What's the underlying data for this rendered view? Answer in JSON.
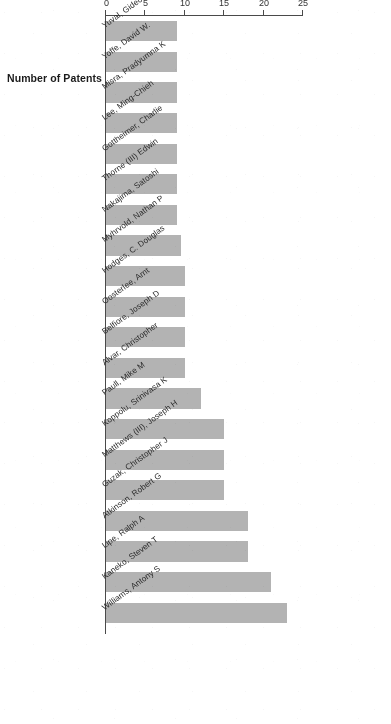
{
  "chart_data": {
    "type": "bar",
    "orientation": "horizontal",
    "title": "",
    "xlabel": "Number of Patents",
    "ylabel": "",
    "xlim": [
      0,
      25
    ],
    "grid": false,
    "legend": null,
    "bar_color": "#b3b3b3",
    "axis_color": "#4a4a4a",
    "text_color": "#2a2a2a",
    "rotation_degrees": 180,
    "tick_labels": [
      "25",
      "20",
      "15",
      "10",
      "5",
      "0"
    ],
    "tick_values": [
      25,
      20,
      15,
      10,
      5,
      0
    ],
    "categories": [
      "Williams, Antony S",
      "Kaneko, Steven T",
      "Lipe, Ralph A",
      "Atkinson, Robert G",
      "Guzak, Christopher J",
      "Matthews (III), Joseph H",
      "Koppolu, Srinivasa K",
      "Paull, Mike M",
      "Alvar, Christopher",
      "Belfiore, Joseph D",
      "Oosterlee, Arnt",
      "Hodges, C. Douglas",
      "Myhrvold, Nathan P",
      "Nakajima, Satoshi",
      "Thorne (III) Edwin",
      "Gottheimer, Charlie",
      "Lee, Ming-Chieh",
      "Misra, Pradyumna K",
      "Yoffe, David W.",
      "Yuval, Gideon A"
    ],
    "values": [
      23,
      21,
      18,
      18,
      15,
      15,
      15,
      12,
      10,
      10,
      10,
      10,
      9.5,
      9,
      9,
      9,
      9,
      9,
      9,
      9
    ]
  },
  "axis": {
    "value_axis_title": "Number of Patents"
  }
}
